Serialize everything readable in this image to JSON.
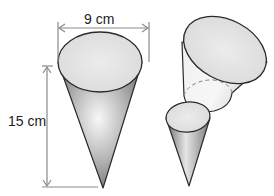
{
  "figure": {
    "labels": {
      "width": "9 cm",
      "height": "15 cm"
    },
    "shapes": [
      {
        "name": "full-cone",
        "diameter": "9 cm",
        "height": "15 cm"
      },
      {
        "name": "frustum-piece"
      },
      {
        "name": "small-cone-piece"
      }
    ],
    "colors": {
      "outline": "#2a2a2a",
      "arrow": "#8a8a8a",
      "face_light": "#e4e4e4",
      "cone_dark": "#6e6e6e",
      "cone_highlight": "#f6f6f6"
    }
  }
}
